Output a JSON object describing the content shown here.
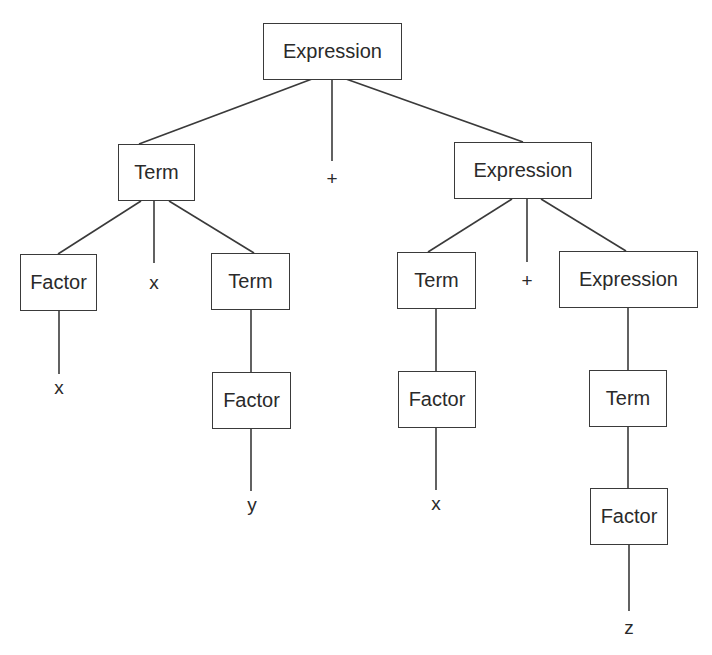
{
  "diagram": {
    "type": "parse-tree",
    "nodes": {
      "root_expression": "Expression",
      "term_left": "Term",
      "plus_top": "+",
      "expression_right": "Expression",
      "factor_ll": "Factor",
      "times_left": "x",
      "term_lr": "Term",
      "leaf_x1": "x",
      "factor_lr": "Factor",
      "leaf_y": "y",
      "term_rl": "Term",
      "plus_right": "+",
      "expression_rr": "Expression",
      "factor_rl": "Factor",
      "leaf_x2": "x",
      "term_rr": "Term",
      "factor_rr": "Factor",
      "leaf_z": "z"
    }
  }
}
